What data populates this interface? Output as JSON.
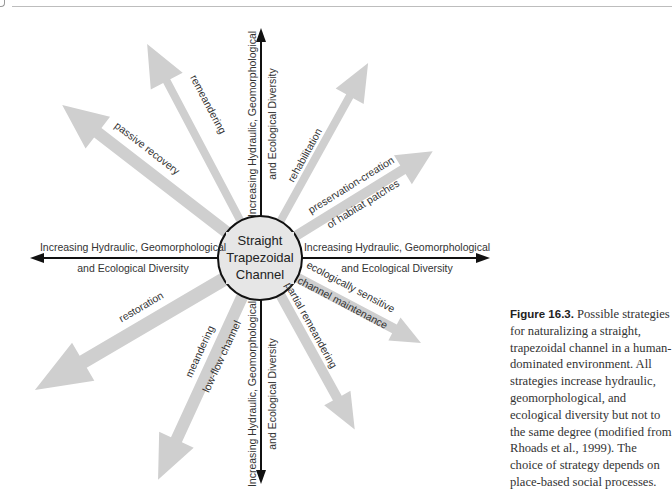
{
  "figure": {
    "center_label": [
      "Straight",
      "Trapezoidal",
      "Channel"
    ],
    "axis_label_line1": "Increasing Hydraulic, Geomorphological",
    "axis_label_line2": "and Ecological Diversity",
    "axes": [
      {
        "direction": "up",
        "line1": "Increasing Hydraulic, Geomorphological",
        "line2": "and Ecological Diversity"
      },
      {
        "direction": "down",
        "line1": "Increasing Hydraulic, Geomorphological",
        "line2": "and Ecological Diversity"
      },
      {
        "direction": "left",
        "line1": "Increasing Hydraulic, Geomorphological",
        "line2": "and Ecological Diversity"
      },
      {
        "direction": "right",
        "line1": "Increasing Hydraulic, Geomorphological",
        "line2": "and Ecological Diversity"
      }
    ],
    "strategies": [
      {
        "label": "passive recovery"
      },
      {
        "label": "remeandering"
      },
      {
        "label": "rehabilitation"
      },
      {
        "label": "preservation-creation",
        "label2": "of habitat patches"
      },
      {
        "label": "restoration"
      },
      {
        "label": "meandering",
        "label2": "low-flow channel"
      },
      {
        "label": "partial remeandering"
      },
      {
        "label": "ecologically sensitive",
        "label2": "channel maintenance"
      }
    ],
    "colors": {
      "strategy_arrow": "#cfcfcf",
      "axis": "#111111",
      "circle_fill": "#e6e6e6",
      "text": "#333333"
    }
  },
  "caption": {
    "figure_number": "Figure 16.3.",
    "text": " Possible strategies for naturalizing a straight, trapezoidal channel in a human-dominated environment. All strategies increase hydraulic, geomorphological, and ecological diversity but not to the same degree (modified from Rhoads et al., 1999). The choice of strategy depends on place-based social processes."
  }
}
